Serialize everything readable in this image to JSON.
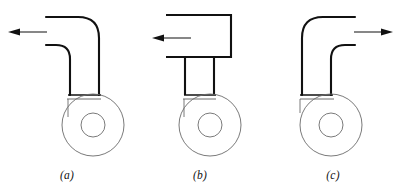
{
  "figure": {
    "background_color": "#ffffff",
    "line_color": "#111111",
    "thin_line_color": "#6b6b6b",
    "width": 401,
    "height": 184,
    "panels": [
      {
        "id": "a",
        "caption": "(a)",
        "elbow_type": "curved-elbow",
        "flow_direction": "left",
        "arrow_label": "",
        "inlet_side": "left-horizontal",
        "outlet_side": "bottom-vertical",
        "wheel": {
          "outer_radius": 31,
          "inner_radius": 12,
          "center_x": 93,
          "center_y": 125
        },
        "arrow": {
          "x1": 47,
          "y1": 32,
          "x2": 8,
          "y2": 32,
          "head": "left"
        }
      },
      {
        "id": "b",
        "caption": "(b)",
        "elbow_type": "square-box",
        "flow_direction": "left",
        "arrow_label": "",
        "inlet_side": "left-horizontal",
        "outlet_side": "bottom-vertical",
        "wheel": {
          "outer_radius": 31,
          "inner_radius": 12,
          "center_x": 91,
          "center_y": 125
        },
        "arrow": {
          "x1": 58,
          "y1": 38,
          "x2": 19,
          "y2": 38,
          "head": "left"
        }
      },
      {
        "id": "c",
        "caption": "(c)",
        "elbow_type": "curved-elbow-mirrored",
        "flow_direction": "right",
        "arrow_label": "",
        "inlet_side": "bottom-vertical",
        "outlet_side": "right-horizontal",
        "wheel": {
          "outer_radius": 31,
          "inner_radius": 12,
          "center_x": 65,
          "center_y": 125
        },
        "arrow": {
          "x1": 88,
          "y1": 32,
          "x2": 127,
          "y2": 32,
          "head": "right"
        }
      }
    ]
  }
}
